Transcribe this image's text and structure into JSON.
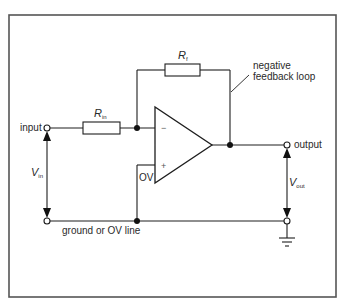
{
  "figure": {
    "type": "circuit-schematic",
    "colors": {
      "line": "#1e1e1e",
      "frame": "#555555",
      "background": "#ffffff"
    }
  },
  "labels": {
    "input": "input",
    "output": "output",
    "ground_line": "ground or OV line",
    "feedback_note_line1": "negative",
    "feedback_note_line2": "feedback loop",
    "zero_volt": "OV",
    "inverting_sign": "−",
    "non_inverting_sign": "+"
  },
  "components": {
    "r_in": {
      "symbol": "R",
      "subscript": "in"
    },
    "r_f": {
      "symbol": "R",
      "subscript": "f"
    },
    "v_in": {
      "symbol": "V",
      "subscript": "in"
    },
    "v_out": {
      "symbol": "V",
      "subscript": "out"
    }
  }
}
